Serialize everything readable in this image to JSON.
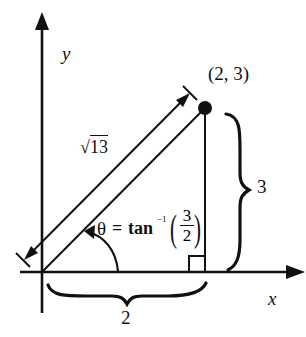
{
  "diagram": {
    "colors": {
      "ink": "#111111",
      "background": "#ffffff"
    },
    "axes": {
      "x_label": "x",
      "y_label": "y"
    },
    "point": {
      "label": "(2, 3)",
      "x": 2,
      "y": 3
    },
    "hypotenuse": {
      "label_radical": "√",
      "label_radicand": "13"
    },
    "horizontal_leg": {
      "label": "2"
    },
    "vertical_leg": {
      "label": "3"
    },
    "angle": {
      "symbol": "θ",
      "equals": "=",
      "func": "tan",
      "exponent": "−1",
      "paren_open": "(",
      "paren_close": ")",
      "numerator": "3",
      "denominator": "2"
    },
    "right_angle_marker": true
  }
}
